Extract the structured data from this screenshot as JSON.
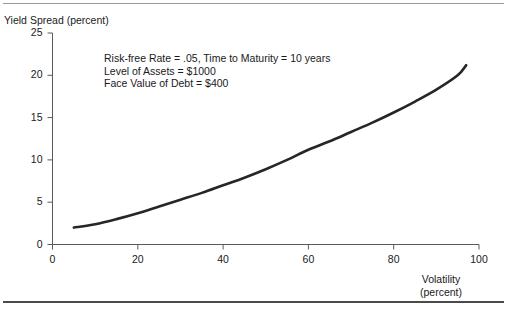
{
  "figure": {
    "width": 507,
    "height": 313,
    "background": "#ffffff",
    "rule_color_top": "#9a9a9a",
    "rule_color_bottom": "#4a4a4a"
  },
  "chart_data": {
    "type": "line",
    "title": "",
    "xlabel": "Volatility",
    "xlabel_line2": "(percent)",
    "ylabel": "Yield Spread (percent)",
    "xlim": [
      0,
      100
    ],
    "ylim": [
      0,
      25
    ],
    "xticks": [
      0,
      20,
      40,
      60,
      80,
      100
    ],
    "yticks": [
      0,
      5,
      10,
      15,
      20,
      25
    ],
    "xtick_labels": [
      "0",
      "20",
      "40",
      "60",
      "80",
      "100"
    ],
    "ytick_labels": [
      "0",
      "5",
      "10",
      "15",
      "20",
      "25"
    ],
    "grid": false,
    "legend": false,
    "series": [
      {
        "name": "Yield Spread",
        "color": "#262626",
        "line_width": 2.6,
        "x": [
          5,
          10,
          15,
          20,
          25,
          30,
          35,
          40,
          45,
          50,
          55,
          60,
          65,
          70,
          75,
          80,
          85,
          90,
          95,
          97
        ],
        "values": [
          2.0,
          2.4,
          3.0,
          3.7,
          4.5,
          5.3,
          6.1,
          7.0,
          7.9,
          8.9,
          10.0,
          11.2,
          12.2,
          13.3,
          14.4,
          15.6,
          16.9,
          18.3,
          20.0,
          21.2
        ]
      }
    ],
    "annotations": [
      "Risk-free Rate = .05, Time to Maturity = 10 years",
      "Level of Assets = $1000",
      "Face Value of Debt = $400"
    ]
  },
  "parameters": {
    "risk_free_rate": ".05",
    "time_to_maturity": "10 years",
    "level_of_assets": "$1000",
    "face_value_of_debt": "$400"
  }
}
